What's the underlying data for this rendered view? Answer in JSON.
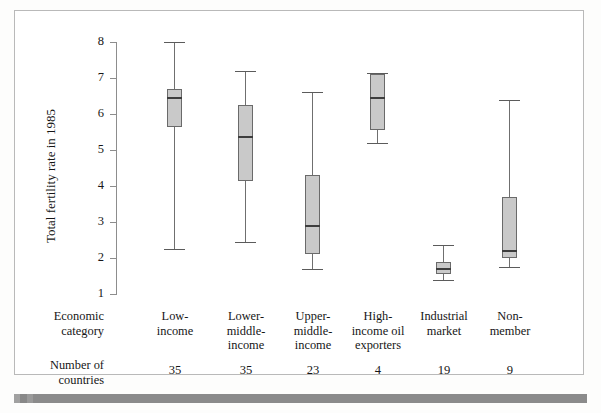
{
  "figure": {
    "background_color": "#ffffff",
    "frame_color": "#b9b9b9",
    "box_fill_color": "#c9c9c9",
    "box_border_color": "#6a6a6a",
    "median_color": "#3d3d3d",
    "whisker_color": "#6f6f6f"
  },
  "axis": {
    "y_title": "Total fertility rate in 1985",
    "y_ticks": [
      "8",
      "7",
      "6",
      "5",
      "4",
      "3",
      "2",
      "1"
    ]
  },
  "table": {
    "row_category_label_line1": "Economic",
    "row_category_label_line2": "category",
    "row_count_label_line1": "Number of",
    "row_count_label_line2": "countries"
  },
  "chart_data": {
    "type": "box",
    "title": "",
    "xlabel": "Economic category",
    "ylabel": "Total fertility rate in 1985",
    "ylim": [
      1,
      8
    ],
    "yticks": [
      1,
      2,
      3,
      4,
      5,
      6,
      7,
      8
    ],
    "grid": false,
    "legend": null,
    "categories": [
      "Low-income",
      "Lower-middle-income",
      "Upper-middle-income",
      "High-income oil exporters",
      "Industrial market",
      "Non-member"
    ],
    "category_lines": [
      [
        "Low-",
        "income"
      ],
      [
        "Lower-",
        "middle-",
        "income"
      ],
      [
        "Upper-",
        "middle-",
        "income"
      ],
      [
        "High-",
        "income oil",
        "exporters"
      ],
      [
        "Industrial",
        "market"
      ],
      [
        "Non-",
        "member"
      ]
    ],
    "counts": [
      35,
      35,
      23,
      4,
      19,
      9
    ],
    "counts_label": "Number of countries",
    "boxes": [
      {
        "category": "Low-income",
        "min": 2.25,
        "q1": 5.65,
        "median": 6.45,
        "q3": 6.7,
        "max": 8.0
      },
      {
        "category": "Lower-middle-income",
        "min": 2.45,
        "q1": 4.15,
        "median": 5.35,
        "q3": 6.25,
        "max": 7.2
      },
      {
        "category": "Upper-middle-income",
        "min": 1.7,
        "q1": 2.1,
        "median": 2.9,
        "q3": 4.3,
        "max": 6.6
      },
      {
        "category": "High-income oil exporters",
        "min": 5.2,
        "q1": 5.55,
        "median": 6.45,
        "q3": 7.1,
        "max": 7.15
      },
      {
        "category": "Industrial market",
        "min": 1.4,
        "q1": 1.55,
        "median": 1.7,
        "q3": 1.9,
        "max": 2.35
      },
      {
        "category": "Non-member",
        "min": 1.75,
        "q1": 2.0,
        "median": 2.2,
        "q3": 3.7,
        "max": 6.4
      }
    ]
  }
}
